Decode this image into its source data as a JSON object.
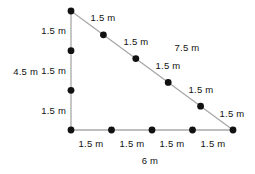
{
  "figure": {
    "name": "right-triangle-measurement-diagram",
    "type": "geometry-diagram",
    "shape": "right triangle",
    "unit": "m",
    "colors": {
      "line": "#a8a8a8",
      "point": "#111111",
      "text": "#111111",
      "background": "#ffffff"
    },
    "vertices": {
      "top": {
        "x": 71,
        "y": 11
      },
      "bottom_left": {
        "x": 71,
        "y": 130
      },
      "bottom_right": {
        "x": 233,
        "y": 130
      }
    },
    "sides": {
      "vertical": {
        "total_label": "4.5 m",
        "segment_label": "1.5 m",
        "segments": 3,
        "segment_length": 1.5,
        "total_length": 4.5
      },
      "horizontal": {
        "total_label": "6 m",
        "segment_label": "1.5 m",
        "segments": 4,
        "segment_length": 1.5,
        "total_length": 6
      },
      "hypotenuse": {
        "total_label": "7.5 m",
        "segment_label": "1.5 m",
        "segments": 5,
        "segment_length": 1.5,
        "total_length": 7.5
      }
    },
    "labels": {
      "vertical_total": "4.5 m",
      "vertical_seg_1": "1.5 m",
      "vertical_seg_2": "1.5 m",
      "vertical_seg_3": "1.5 m",
      "horizontal_total": "6 m",
      "horizontal_seg_1": "1.5 m",
      "horizontal_seg_2": "1.5 m",
      "horizontal_seg_3": "1.5 m",
      "horizontal_seg_4": "1.5 m",
      "hypotenuse_total": "7.5 m",
      "hypotenuse_seg_1": "1.5 m",
      "hypotenuse_seg_2": "1.5 m",
      "hypotenuse_seg_3": "1.5 m",
      "hypotenuse_seg_4": "1.5 m",
      "hypotenuse_seg_5": "1.5 m"
    }
  }
}
